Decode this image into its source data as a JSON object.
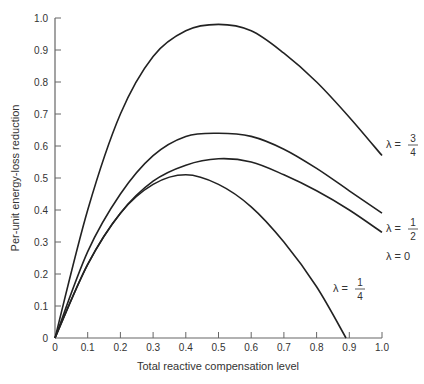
{
  "chart_data": {
    "type": "line",
    "title": "",
    "xlabel": "Total reactive compensation level",
    "ylabel": "Per-unit energy-loss reduction",
    "xlim": [
      0,
      1.0
    ],
    "ylim": [
      0,
      1.0
    ],
    "grid": false,
    "legend_position": "inline labels at right end of curves",
    "x_ticks": [
      "0",
      "0.1",
      "0.2",
      "0.3",
      "0.4",
      "0.5",
      "0.6",
      "0.7",
      "0.8",
      "0.9",
      "1.0"
    ],
    "y_ticks": [
      "0",
      "0.1",
      "0.2",
      "0.3",
      "0.4",
      "0.5",
      "0.6",
      "0.7",
      "0.8",
      "0.9",
      "1.0"
    ],
    "x": [
      0,
      0.1,
      0.2,
      0.3,
      0.4,
      0.5,
      0.6,
      0.7,
      0.8,
      0.9,
      1.0
    ],
    "series": [
      {
        "name": "λ = 3/4",
        "label_main": "λ =",
        "label_num": "3",
        "label_den": "4",
        "values": [
          0,
          0.4,
          0.7,
          0.88,
          0.96,
          0.98,
          0.96,
          0.89,
          0.8,
          0.69,
          0.57
        ]
      },
      {
        "name": "λ = 1/2",
        "label_main": "λ =",
        "label_num": "1",
        "label_den": "2",
        "values": [
          0,
          0.27,
          0.45,
          0.57,
          0.63,
          0.64,
          0.63,
          0.59,
          0.53,
          0.46,
          0.39
        ]
      },
      {
        "name": "λ = 0",
        "label_main": "λ = 0",
        "label_num": "",
        "label_den": "",
        "values": [
          0,
          0.23,
          0.39,
          0.49,
          0.54,
          0.56,
          0.55,
          0.51,
          0.46,
          0.4,
          0.33
        ]
      },
      {
        "name": "λ = 1/4",
        "label_main": "λ =",
        "label_num": "1",
        "label_den": "4",
        "values": [
          0,
          0.23,
          0.39,
          0.48,
          0.51,
          0.48,
          0.41,
          0.3,
          0.16,
          null,
          null
        ],
        "x_end": 0.89
      }
    ]
  }
}
